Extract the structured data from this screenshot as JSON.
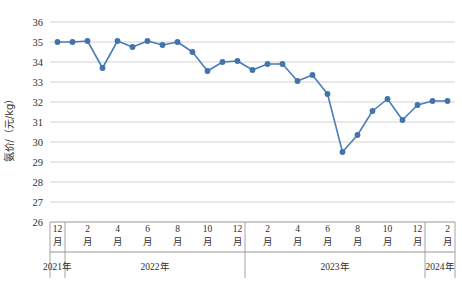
{
  "chart_data": {
    "type": "line",
    "title": "",
    "xlabel": "",
    "ylabel": "氨价/（元/kg）",
    "ylim": [
      26,
      36
    ],
    "ytick_values": [
      26,
      27,
      28,
      29,
      30,
      31,
      32,
      33,
      34,
      35,
      36
    ],
    "grid": true,
    "legend": "none",
    "series_color": "#4273ab",
    "x": [
      "12月",
      "1月",
      "2月",
      "3月",
      "4月",
      "5月",
      "6月",
      "7月",
      "8月",
      "9月",
      "10月",
      "11月",
      "12月",
      "1月",
      "2月",
      "3月",
      "4月",
      "5月",
      "6月",
      "7月",
      "8月",
      "9月",
      "10月",
      "11月",
      "12月",
      "1月",
      "2月"
    ],
    "x_tick_labels": [
      {
        "num": "12",
        "unit": "月"
      },
      {
        "num": "2",
        "unit": "月"
      },
      {
        "num": "4",
        "unit": "月"
      },
      {
        "num": "6",
        "unit": "月"
      },
      {
        "num": "8",
        "unit": "月"
      },
      {
        "num": "10",
        "unit": "月"
      },
      {
        "num": "12",
        "unit": "月"
      },
      {
        "num": "2",
        "unit": "月"
      },
      {
        "num": "4",
        "unit": "月"
      },
      {
        "num": "6",
        "unit": "月"
      },
      {
        "num": "8",
        "unit": "月"
      },
      {
        "num": "10",
        "unit": "月"
      },
      {
        "num": "12",
        "unit": "月"
      },
      {
        "num": "2",
        "unit": "月"
      }
    ],
    "year_groups": [
      {
        "label": "2021年",
        "start_index": 0,
        "end_index": 0
      },
      {
        "label": "2022年",
        "start_index": 1,
        "end_index": 12
      },
      {
        "label": "2023年",
        "start_index": 13,
        "end_index": 24
      },
      {
        "label": "2024年",
        "start_index": 25,
        "end_index": 26
      }
    ],
    "values": [
      35.0,
      35.0,
      35.05,
      33.7,
      35.05,
      34.75,
      35.05,
      34.85,
      35.0,
      34.5,
      33.55,
      34.0,
      34.05,
      33.6,
      33.9,
      33.9,
      33.05,
      33.35,
      32.4,
      29.5,
      30.35,
      31.55,
      32.15,
      31.1,
      31.85,
      32.05,
      32.05
    ],
    "series_name": "氨价"
  },
  "caption": ""
}
